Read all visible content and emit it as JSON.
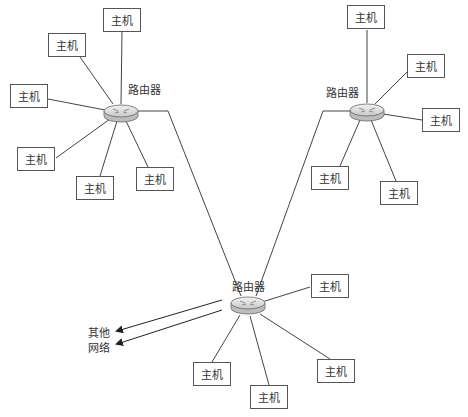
{
  "diagram": {
    "type": "network-topology",
    "router_label": "路由器",
    "host_label": "主机",
    "external_label_line1": "其他",
    "external_label_line2": "网络",
    "routers": [
      {
        "id": "router-left",
        "label": "路由器",
        "x": 121,
        "y": 112
      },
      {
        "id": "router-right",
        "label": "路由器",
        "x": 366,
        "y": 111
      },
      {
        "id": "router-bottom",
        "label": "路由器",
        "x": 248,
        "y": 306
      }
    ],
    "hosts": [
      {
        "id": "h1",
        "label": "主机",
        "router": "router-left"
      },
      {
        "id": "h2",
        "label": "主机",
        "router": "router-left"
      },
      {
        "id": "h3",
        "label": "主机",
        "router": "router-left"
      },
      {
        "id": "h4",
        "label": "主机",
        "router": "router-left"
      },
      {
        "id": "h5",
        "label": "主机",
        "router": "router-left"
      },
      {
        "id": "h6",
        "label": "主机",
        "router": "router-left"
      },
      {
        "id": "h7",
        "label": "主机",
        "router": "router-right"
      },
      {
        "id": "h8",
        "label": "主机",
        "router": "router-right"
      },
      {
        "id": "h9",
        "label": "主机",
        "router": "router-right"
      },
      {
        "id": "h10",
        "label": "主机",
        "router": "router-right"
      },
      {
        "id": "h11",
        "label": "主机",
        "router": "router-right"
      },
      {
        "id": "h12",
        "label": "主机",
        "router": "router-bottom"
      },
      {
        "id": "h13",
        "label": "主机",
        "router": "router-bottom"
      },
      {
        "id": "h14",
        "label": "主机",
        "router": "router-bottom"
      },
      {
        "id": "h15",
        "label": "主机",
        "router": "router-bottom"
      }
    ],
    "links": [
      [
        "router-left",
        "router-bottom"
      ],
      [
        "router-right",
        "router-bottom"
      ],
      [
        "router-bottom",
        "其他网络"
      ]
    ]
  }
}
